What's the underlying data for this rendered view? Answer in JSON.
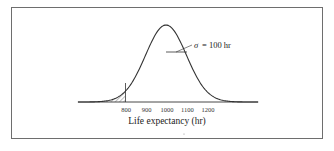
{
  "chart_data": {
    "type": "line",
    "title": "",
    "xlabel": "Life expectancy (hr)",
    "ylabel": "",
    "distribution": "normal",
    "mean": 1000,
    "sigma": 100,
    "x_ticks": [
      800,
      900,
      1000,
      1100,
      1200
    ],
    "x_tick_labels": [
      "800",
      "900",
      "1000",
      "1100",
      "1200"
    ],
    "xlim": [
      570,
      1450
    ],
    "shaded_region": {
      "from": 570,
      "to": 800,
      "style": "hatched",
      "label": "left tail below 800"
    },
    "annotations": [
      {
        "text": "σ = 100 hr",
        "at_x": 1100
      }
    ],
    "grid": false,
    "legend": null
  },
  "labels": {
    "xlabel": "Life expectancy (hr)",
    "sigma_symbol": "σ",
    "sigma_eq": "= 100 hr",
    "ticks": [
      "800",
      "900",
      "1000",
      "1100",
      "1200"
    ]
  },
  "colors": {
    "curve": "#333333",
    "frame": "#6e6e6e",
    "text": "#222222"
  }
}
